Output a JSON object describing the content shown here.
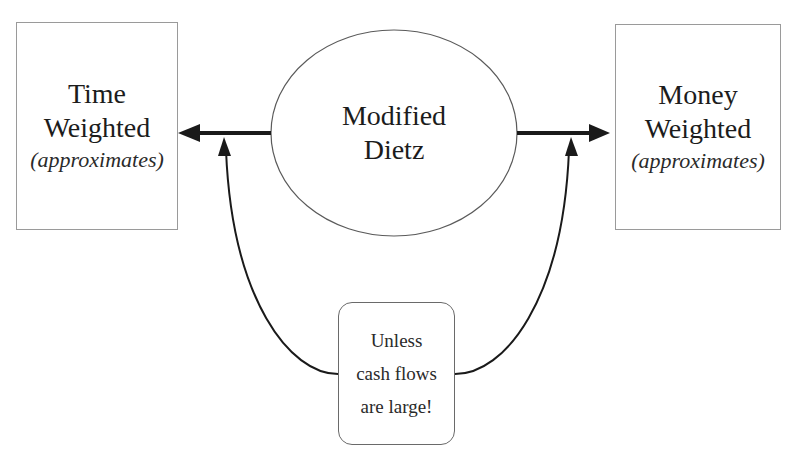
{
  "diagram": {
    "left_node": {
      "line1": "Time",
      "line2": "Weighted",
      "note": "(approximates)"
    },
    "center_node": {
      "line1": "Modified",
      "line2": "Dietz",
      "shape": "ellipse"
    },
    "right_node": {
      "line1": "Money",
      "line2": "Weighted",
      "note": "(approximates)"
    },
    "caveat_node": {
      "line1": "Unless",
      "line2": "cash flows",
      "line3": "are large!",
      "shape": "rounded-rectangle"
    },
    "edges": [
      {
        "from": "Modified Dietz",
        "to": "Time Weighted",
        "style": "thick-arrow"
      },
      {
        "from": "Modified Dietz",
        "to": "Money Weighted",
        "style": "thick-arrow"
      },
      {
        "from": "Unless cash flows are large!",
        "to": "left arrow",
        "style": "curved-thin-arrow"
      },
      {
        "from": "Unless cash flows are large!",
        "to": "right arrow",
        "style": "curved-thin-arrow"
      }
    ],
    "colors": {
      "stroke": "#1a1a1a",
      "box_border": "#9a9a9a",
      "background": "#ffffff"
    }
  }
}
